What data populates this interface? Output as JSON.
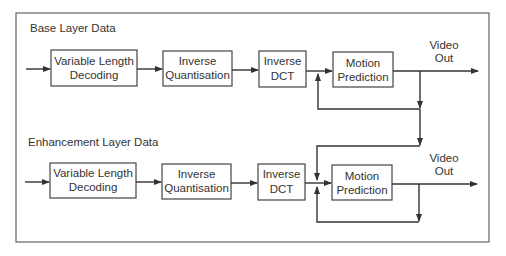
{
  "diagram": {
    "layers": [
      {
        "title": "Base Layer Data",
        "blocks": [
          {
            "id": "vld",
            "line1": "Variable Length",
            "line2": "Decoding"
          },
          {
            "id": "iq",
            "line1": "Inverse",
            "line2": "Quantisation"
          },
          {
            "id": "idct",
            "line1": "Inverse",
            "line2": "DCT"
          },
          {
            "id": "mp",
            "line1": "Motion",
            "line2": "Prediction"
          }
        ],
        "output": {
          "line1": "Video",
          "line2": "Out"
        }
      },
      {
        "title": "Enhancement Layer Data",
        "blocks": [
          {
            "id": "vld",
            "line1": "Variable Length",
            "line2": "Decoding"
          },
          {
            "id": "iq",
            "line1": "Inverse",
            "line2": "Quantisation"
          },
          {
            "id": "idct",
            "line1": "Inverse",
            "line2": "DCT"
          },
          {
            "id": "mp",
            "line1": "Motion",
            "line2": "Prediction"
          }
        ],
        "output": {
          "line1": "Video",
          "line2": "Out"
        }
      }
    ],
    "connections": [
      "input -> Variable Length Decoding -> Inverse Quantisation -> Inverse DCT -> Motion Prediction -> Video Out (per layer)",
      "Base Video Out feeds back into base Motion Prediction input",
      "Base Video Out feeds down into enhancement Motion Prediction input",
      "Enhancement Video Out feeds back into enhancement Motion Prediction input"
    ]
  }
}
